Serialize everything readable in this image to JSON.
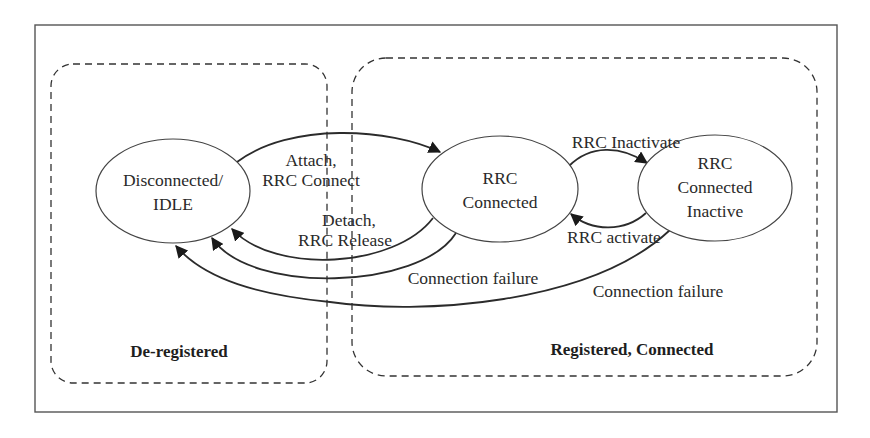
{
  "diagram": {
    "type": "state-transition",
    "regions": [
      {
        "id": "deregistered",
        "label": "De-registered"
      },
      {
        "id": "registered",
        "label": "Registered, Connected"
      }
    ],
    "states": [
      {
        "id": "idle",
        "lines": [
          "Disconnected/",
          "IDLE"
        ]
      },
      {
        "id": "rrc_connected",
        "lines": [
          "RRC",
          "Connected"
        ]
      },
      {
        "id": "rrc_inactive",
        "lines": [
          "RRC",
          "Connected",
          "Inactive"
        ]
      }
    ],
    "transitions": [
      {
        "id": "attach",
        "from": "idle",
        "to": "rrc_connected",
        "lines": [
          "Attach,",
          "RRC Connect"
        ]
      },
      {
        "id": "detach",
        "from": "rrc_connected",
        "to": "idle",
        "lines": [
          "Detach,",
          "RRC Release"
        ]
      },
      {
        "id": "conn_fail_connected",
        "from": "rrc_connected",
        "to": "idle",
        "label": "Connection failure"
      },
      {
        "id": "conn_fail_inactive",
        "from": "rrc_inactive",
        "to": "idle",
        "label": "Connection failure"
      },
      {
        "id": "inactivate",
        "from": "rrc_connected",
        "to": "rrc_inactive",
        "label": "RRC Inactivate"
      },
      {
        "id": "activate",
        "from": "rrc_inactive",
        "to": "rrc_connected",
        "label": "RRC activate"
      }
    ]
  }
}
